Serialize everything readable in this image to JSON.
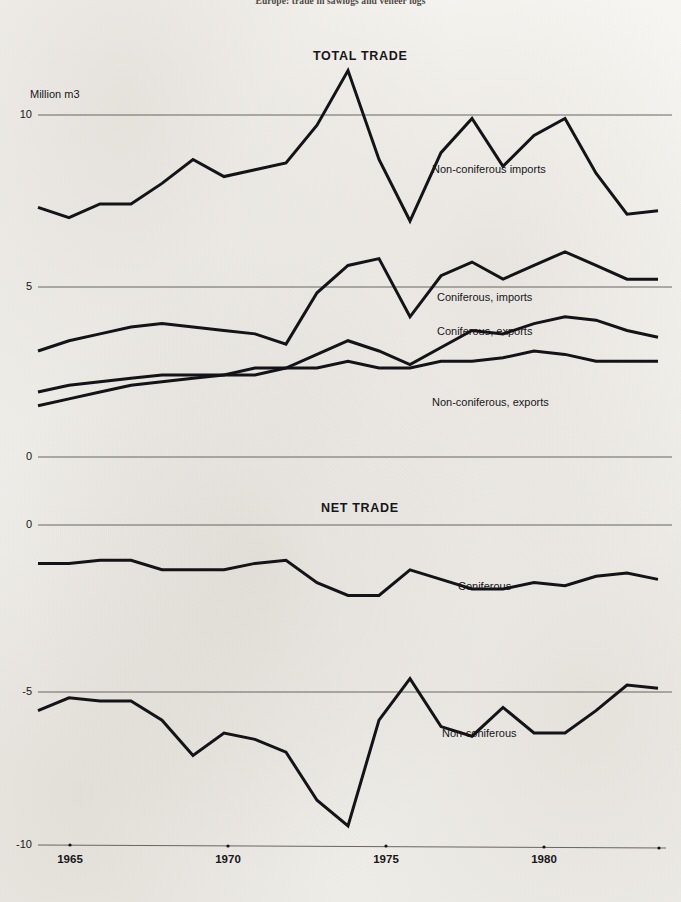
{
  "figure": {
    "title": "Europe: trade in sawlogs and veneer logs",
    "unit_label": "Million m3",
    "panels": {
      "top_title": "TOTAL TRADE",
      "bottom_title": "NET TRADE"
    }
  },
  "axes": {
    "top_yticks": [
      "10",
      "5",
      "0"
    ],
    "bottom_yticks": [
      "0",
      "-5",
      "-10"
    ],
    "xticks": [
      "1965",
      "1970",
      "1975",
      "1980"
    ]
  },
  "labels": {
    "noncon_imports": "Non-coniferous imports",
    "con_imports": "Coniferous, imports",
    "con_exports": "Coniferous, exports",
    "noncon_exports": "Non-coniferous, exports",
    "net_coniferous": "Coniferous",
    "net_nonconiferous": "Non-coniferous"
  },
  "colors": {
    "paper": "#f3f1ed",
    "ink": "#141317",
    "grid": "#5a5753"
  },
  "chart_data": {
    "type": "line",
    "title": "Europe: trade in sawlogs and veneer logs",
    "xlabel": "",
    "ylabel": "Million m3",
    "grid": true,
    "legend": "inline-annotations",
    "panels": [
      {
        "name": "TOTAL TRADE",
        "ylim": [
          0,
          11.5
        ],
        "yticks": [
          0,
          5,
          10
        ],
        "x": [
          1963,
          1964,
          1965,
          1966,
          1967,
          1968,
          1969,
          1970,
          1971,
          1972,
          1973,
          1974,
          1975,
          1976,
          1977,
          1978,
          1979,
          1980,
          1981,
          1982,
          1983
        ],
        "series": [
          {
            "name": "Non-coniferous imports",
            "values": [
              7.3,
              7.0,
              7.4,
              7.4,
              8.0,
              8.7,
              8.2,
              8.4,
              8.6,
              9.7,
              11.3,
              8.7,
              6.9,
              8.9,
              9.9,
              8.5,
              9.4,
              9.9,
              8.3,
              7.1,
              7.2
            ]
          },
          {
            "name": "Coniferous, imports",
            "values": [
              3.1,
              3.4,
              3.6,
              3.8,
              3.9,
              3.8,
              3.7,
              3.6,
              3.3,
              4.8,
              5.6,
              5.8,
              4.1,
              5.3,
              5.7,
              5.2,
              5.6,
              6.0,
              5.6,
              5.2,
              5.2
            ]
          },
          {
            "name": "Coniferous, exports",
            "values": [
              1.9,
              2.1,
              2.2,
              2.3,
              2.4,
              2.4,
              2.4,
              2.6,
              2.6,
              3.0,
              3.4,
              3.1,
              2.7,
              3.2,
              3.7,
              3.6,
              3.9,
              4.1,
              4.0,
              3.7,
              3.5
            ]
          },
          {
            "name": "Non-coniferous, exports",
            "values": [
              1.5,
              1.7,
              1.9,
              2.1,
              2.2,
              2.3,
              2.4,
              2.4,
              2.6,
              2.6,
              2.8,
              2.6,
              2.6,
              2.8,
              2.8,
              2.9,
              3.1,
              3.0,
              2.8,
              2.8,
              2.8
            ]
          }
        ]
      },
      {
        "name": "NET TRADE",
        "ylim": [
          -10.5,
          0.5
        ],
        "yticks": [
          -10,
          -5,
          0
        ],
        "x": [
          1963,
          1964,
          1965,
          1966,
          1967,
          1968,
          1969,
          1970,
          1971,
          1972,
          1973,
          1974,
          1975,
          1976,
          1977,
          1978,
          1979,
          1980,
          1981,
          1982,
          1983
        ],
        "series": [
          {
            "name": "Coniferous",
            "values": [
              -1.2,
              -1.2,
              -1.1,
              -1.1,
              -1.4,
              -1.4,
              -1.4,
              -1.2,
              -1.1,
              -1.8,
              -2.2,
              -2.2,
              -1.4,
              -1.7,
              -2.0,
              -2.0,
              -1.8,
              -1.9,
              -1.6,
              -1.5,
              -1.7
            ]
          },
          {
            "name": "Non-coniferous",
            "values": [
              -5.8,
              -5.4,
              -5.5,
              -5.5,
              -6.1,
              -7.2,
              -6.5,
              -6.7,
              -7.1,
              -8.6,
              -9.4,
              -6.1,
              -4.8,
              -6.3,
              -6.6,
              -5.7,
              -6.5,
              -6.5,
              -5.8,
              -5.0,
              -5.1
            ]
          }
        ]
      }
    ]
  },
  "geometry": {
    "x_start_px": 38,
    "x_end_px": 658,
    "year_start": 1963,
    "year_end": 1983,
    "top_y10_px": 115,
    "top_y5_px": 287,
    "top_y0_px": 457,
    "bot_y0_px": 525,
    "bot_ym5_px": 692,
    "bot_ym10_px": 845
  }
}
